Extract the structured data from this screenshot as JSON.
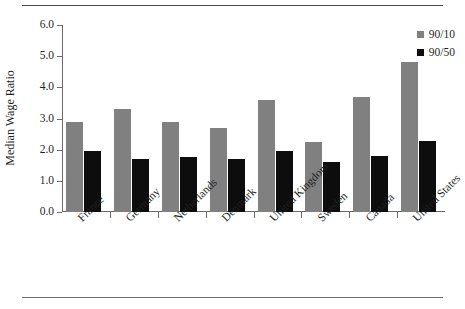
{
  "chart_data": {
    "type": "bar",
    "title": "",
    "xlabel": "",
    "ylabel": "Median Wage Ratio",
    "ylim": [
      0.0,
      6.0
    ],
    "ytick_step": 1.0,
    "ytick_labels": [
      "0.0",
      "1.0",
      "2.0",
      "3.0",
      "4.0",
      "5.0",
      "6.0"
    ],
    "grid": false,
    "legend_position": "top-right",
    "categories": [
      "France",
      "Germany",
      "Netherlands",
      "Denmark",
      "United Kingdom",
      "Sweden",
      "Canada",
      "United States"
    ],
    "series": [
      {
        "name": "90/10",
        "color": "#808080",
        "values": [
          2.9,
          3.3,
          2.9,
          2.7,
          3.6,
          2.25,
          3.7,
          4.8
        ]
      },
      {
        "name": "90/50",
        "color": "#0d0d0d",
        "values": [
          1.95,
          1.7,
          1.75,
          1.7,
          1.95,
          1.6,
          1.8,
          2.28
        ]
      }
    ]
  },
  "legend": {
    "items": [
      {
        "label": "90/10",
        "color": "#808080"
      },
      {
        "label": "90/50",
        "color": "#0d0d0d"
      }
    ]
  }
}
